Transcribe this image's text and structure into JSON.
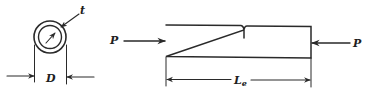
{
  "diagram": {
    "cross_section": {
      "shape": "hollow circular tube",
      "labels": {
        "thickness": "t",
        "diameter": "D"
      }
    },
    "column": {
      "labels": {
        "load_left": "P",
        "load_right": "P",
        "length_main": "L",
        "length_sub": "e"
      }
    },
    "colors": {
      "line": "#2a2a2a",
      "text": "#1e1e1e",
      "background": "#ffffff"
    }
  }
}
